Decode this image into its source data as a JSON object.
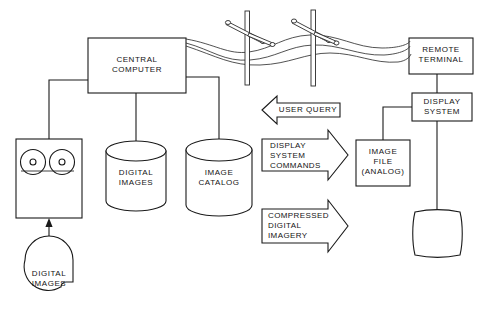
{
  "diagram": {
    "colors": {
      "background": "#ffffff",
      "line": "#1a1a1a",
      "wire": "#333333",
      "text": "#141414"
    },
    "nodes": {
      "central_computer": {
        "label": "CENTRAL\nCOMPUTER",
        "shape": "rectangle"
      },
      "tape_drive": {
        "label": "",
        "shape": "tape-drive",
        "reels": 2
      },
      "digital_images_store": {
        "label": "DIGITAL\nIMAGES",
        "shape": "cylinder"
      },
      "image_catalog_store": {
        "label": "IMAGE\nCATALOG",
        "shape": "cylinder"
      },
      "digital_images_tape": {
        "label": "DIGITAL\nIMAGES",
        "shape": "tape-reel-symbol"
      },
      "remote_terminal": {
        "label": "REMOTE\nTERMINAL",
        "shape": "rectangle"
      },
      "display_system": {
        "label": "DISPLAY\nSYSTEM",
        "shape": "rectangle"
      },
      "image_file": {
        "label": "IMAGE\nFILE\n(ANALOG)",
        "shape": "rectangle"
      },
      "monitor": {
        "label": "",
        "shape": "crt-screen"
      }
    },
    "arrows": [
      {
        "name": "user-query",
        "label": "USER QUERY",
        "direction": "left",
        "align": "center"
      },
      {
        "name": "display-system-commands",
        "label": "DISPLAY\nSYSTEM\nCOMMANDS",
        "direction": "right",
        "align": "left"
      },
      {
        "name": "compressed-digital-imagery",
        "label": "COMPRESSED\nDIGITAL\nIMAGERY",
        "direction": "right",
        "align": "left"
      }
    ],
    "transmission_link": {
      "name": "overhead-telephone-line",
      "pole_count": 2,
      "wire_count": 3
    }
  }
}
